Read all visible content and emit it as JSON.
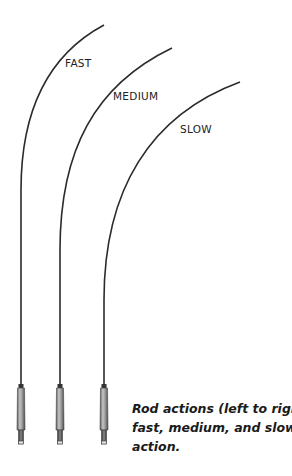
{
  "diagram": {
    "labels": {
      "fast": "FAST",
      "medium": "MEDIUM",
      "slow": "SLOW"
    },
    "caption": {
      "line1": "Rod actions (left to right):",
      "line2": "fast, medium, and slow",
      "line3": "action."
    },
    "rods": [
      {
        "name": "fast",
        "order": 1
      },
      {
        "name": "medium",
        "order": 2
      },
      {
        "name": "slow",
        "order": 3
      }
    ],
    "colors": {
      "line": "#2b2b2b",
      "handle": "#8a8a8a",
      "caption": "#1a1a1a"
    }
  }
}
